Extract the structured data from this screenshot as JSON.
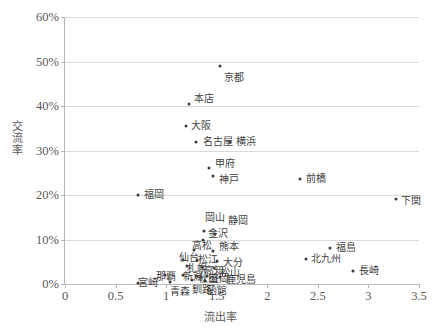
{
  "chart_data": {
    "type": "scatter",
    "title": "",
    "xlabel": "流出率",
    "ylabel": "交流率",
    "xlim": [
      0,
      3.5
    ],
    "ylim": [
      0,
      0.6
    ],
    "grid": true,
    "legend": "none",
    "xticks": [
      "0",
      "0.5",
      "1",
      "1.5",
      "2",
      "2.5",
      "3",
      "3.5"
    ],
    "xtick_values": [
      0,
      0.5,
      1,
      1.5,
      2,
      2.5,
      3,
      3.5
    ],
    "yticks": [
      "0%",
      "10%",
      "20%",
      "30%",
      "40%",
      "50%",
      "60%"
    ],
    "ytick_values": [
      0,
      0.1,
      0.2,
      0.3,
      0.4,
      0.5,
      0.6
    ],
    "points": [
      {
        "label": "京都",
        "x": 1.53,
        "y": 0.49,
        "lx": 4,
        "ly": 12
      },
      {
        "label": "本店",
        "x": 1.23,
        "y": 0.405,
        "lx": 5,
        "ly": -5
      },
      {
        "label": "大阪",
        "x": 1.2,
        "y": 0.355,
        "lx": 5,
        "ly": 0
      },
      {
        "label": "名古屋",
        "x": 1.3,
        "y": 0.32,
        "lx": 7,
        "ly": 0
      },
      {
        "label": "横浜",
        "x": 1.63,
        "y": 0.32,
        "lx": 6,
        "ly": 0
      },
      {
        "label": "甲府",
        "x": 1.42,
        "y": 0.26,
        "lx": 6,
        "ly": -4
      },
      {
        "label": "神戸",
        "x": 1.46,
        "y": 0.242,
        "lx": 6,
        "ly": 4
      },
      {
        "label": "前橋",
        "x": 2.32,
        "y": 0.235,
        "lx": 6,
        "ly": 0
      },
      {
        "label": "下関",
        "x": 3.27,
        "y": 0.19,
        "lx": 5,
        "ly": 2
      },
      {
        "label": "福岡",
        "x": 0.72,
        "y": 0.2,
        "lx": 6,
        "ly": 0
      },
      {
        "label": "岡山",
        "x": 1.37,
        "y": 0.118,
        "lx": 1,
        "ly": -13
      },
      {
        "label": "静岡",
        "x": 1.48,
        "y": 0.112,
        "lx": 13,
        "ly": -13
      },
      {
        "label": "金沢",
        "x": 1.36,
        "y": 0.098,
        "lx": 5,
        "ly": -6
      },
      {
        "label": "福島",
        "x": 2.62,
        "y": 0.08,
        "lx": 6,
        "ly": 0
      },
      {
        "label": "高松",
        "x": 1.28,
        "y": 0.077,
        "lx": -2,
        "ly": -4
      },
      {
        "label": "熊本",
        "x": 1.46,
        "y": 0.075,
        "lx": 6,
        "ly": -4
      },
      {
        "label": "北九州",
        "x": 2.38,
        "y": 0.057,
        "lx": 5,
        "ly": 0
      },
      {
        "label": "仙台",
        "x": 1.17,
        "y": 0.055,
        "lx": -4,
        "ly": -2
      },
      {
        "label": "松江",
        "x": 1.31,
        "y": 0.055,
        "lx": 1,
        "ly": 0
      },
      {
        "label": "大分",
        "x": 1.5,
        "y": 0.052,
        "lx": 6,
        "ly": 2
      },
      {
        "label": "札幌",
        "x": 1.21,
        "y": 0.04,
        "lx": 0,
        "ly": 3
      },
      {
        "label": "高知",
        "x": 1.35,
        "y": 0.038,
        "lx": 2,
        "ly": 4
      },
      {
        "label": "松山",
        "x": 1.47,
        "y": 0.035,
        "lx": 6,
        "ly": 5
      },
      {
        "label": "長崎",
        "x": 2.85,
        "y": 0.03,
        "lx": 6,
        "ly": 0
      },
      {
        "label": "那覇",
        "x": 0.99,
        "y": 0.02,
        "lx": -9,
        "ly": 2
      },
      {
        "label": "新潟",
        "x": 1.17,
        "y": 0.02,
        "lx": 0,
        "ly": 2
      },
      {
        "label": "秋田",
        "x": 1.3,
        "y": 0.018,
        "lx": 2,
        "ly": 3
      },
      {
        "label": "盛岡",
        "x": 1.4,
        "y": 0.018,
        "lx": 2,
        "ly": 3
      },
      {
        "label": "鹿児島",
        "x": 1.53,
        "y": 0.015,
        "lx": 6,
        "ly": 3
      },
      {
        "label": "釧路",
        "x": 1.26,
        "y": 0.008,
        "lx": 0,
        "ly": 10
      },
      {
        "label": "函館",
        "x": 1.38,
        "y": 0.006,
        "lx": 2,
        "ly": 10
      },
      {
        "label": "青森",
        "x": 1.04,
        "y": 0.005,
        "lx": 0,
        "ly": 10
      },
      {
        "label": "宮崎",
        "x": 0.72,
        "y": 0.003,
        "lx": 0,
        "ly": 0
      }
    ]
  },
  "axis": {
    "x_title": "流出率",
    "y_title": "交流率"
  }
}
